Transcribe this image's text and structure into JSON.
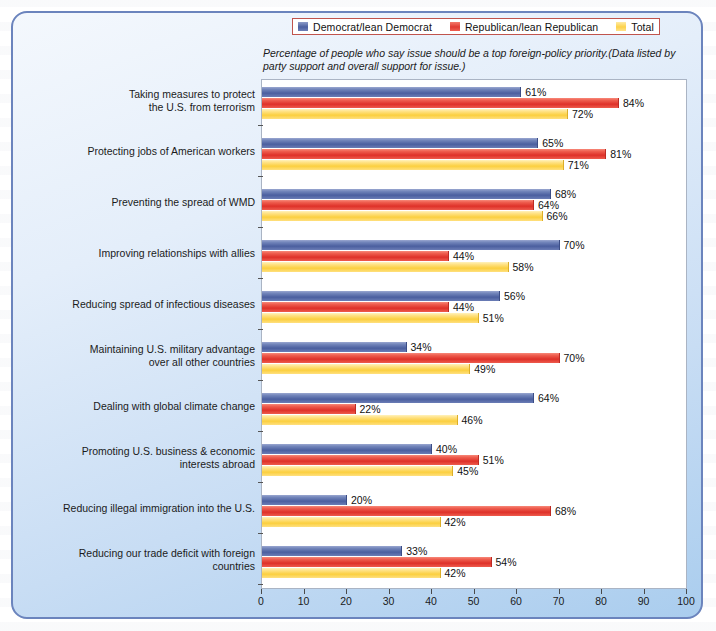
{
  "legend": {
    "items": [
      {
        "label": "Democrat/lean Democrat",
        "color": "#4b5f9f",
        "key": "dem"
      },
      {
        "label": "Republican/lean Republican",
        "color": "#de3129",
        "key": "rep"
      },
      {
        "label": "Total",
        "color": "#fbcf3f",
        "key": "tot"
      }
    ]
  },
  "subtitle": "Percentage of people who say issue should be a top foreign-policy priority.(Data listed by party support and overall support for issue.)",
  "chart_data": {
    "type": "bar",
    "orientation": "horizontal",
    "title": "",
    "subtitle": "Percentage of people who say issue should be a top foreign-policy priority.(Data listed by party support and overall support for issue.)",
    "xlabel": "",
    "ylabel": "",
    "xlim": [
      0,
      100
    ],
    "xticks": [
      0,
      10,
      20,
      30,
      40,
      50,
      60,
      70,
      80,
      90,
      100
    ],
    "xtick_labels": [
      "0",
      "10",
      "20",
      "30",
      "40",
      "50",
      "60",
      "70",
      "80",
      "90",
      "100"
    ],
    "grid": false,
    "legend_position": "top",
    "value_suffix": "%",
    "categories": [
      "Taking measures to protect the U.S. from terrorism",
      "Protecting jobs of American workers",
      "Preventing the spread of WMD",
      "Improving relationships with allies",
      "Reducing spread of infectious diseases",
      "Maintaining U.S. military advantage over all other countries",
      "Dealing with global climate change",
      "Promoting U.S. business & economic interests abroad",
      "Reducing illegal immigration into the U.S.",
      "Reducing our trade deficit with foreign countries"
    ],
    "category_lines": [
      [
        "Taking measures to protect",
        "the U.S. from terrorism"
      ],
      [
        "Protecting jobs of American workers"
      ],
      [
        "Preventing the spread of WMD"
      ],
      [
        "Improving relationships with allies"
      ],
      [
        "Reducing spread of infectious diseases"
      ],
      [
        "Maintaining U.S. military advantage",
        "over all other countries"
      ],
      [
        "Dealing with global climate change"
      ],
      [
        "Promoting U.S. business & economic",
        "interests abroad"
      ],
      [
        "Reducing illegal immigration into the U.S."
      ],
      [
        "Reducing our trade deficit with foreign",
        "countries"
      ]
    ],
    "series": [
      {
        "name": "Democrat/lean Democrat",
        "color": "#4b5f9f",
        "values": [
          61,
          65,
          68,
          70,
          56,
          34,
          64,
          40,
          20,
          33
        ],
        "labels": [
          "61%",
          "65%",
          "68%",
          "70%",
          "56%",
          "34%",
          "64%",
          "40%",
          "20%",
          "33%"
        ]
      },
      {
        "name": "Republican/lean Republican",
        "color": "#de3129",
        "values": [
          84,
          81,
          64,
          44,
          44,
          70,
          22,
          51,
          68,
          54
        ],
        "labels": [
          "84%",
          "81%",
          "64%",
          "44%",
          "44%",
          "70%",
          "22%",
          "51%",
          "68%",
          "54%"
        ]
      },
      {
        "name": "Total",
        "color": "#fbcf3f",
        "values": [
          72,
          71,
          66,
          58,
          51,
          49,
          46,
          45,
          42,
          42
        ],
        "labels": [
          "72%",
          "71%",
          "66%",
          "58%",
          "51%",
          "49%",
          "46%",
          "45%",
          "42%",
          "42%"
        ]
      }
    ]
  }
}
